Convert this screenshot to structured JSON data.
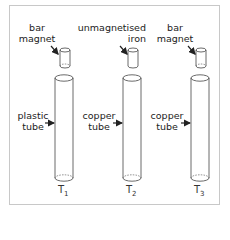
{
  "diagram": {
    "title": "",
    "setups": [
      {
        "id": "T1",
        "tube_label": {
          "base": "T",
          "sub": "1"
        },
        "object": {
          "line1": "bar",
          "line2": "magnet"
        },
        "tube": {
          "line1": "plastic",
          "line2": "tube"
        }
      },
      {
        "id": "T2",
        "tube_label": {
          "base": "T",
          "sub": "2"
        },
        "object": {
          "line1": "unmagnetised",
          "line2": "iron"
        },
        "tube": {
          "line1": "copper",
          "line2": "tube"
        }
      },
      {
        "id": "T3",
        "tube_label": {
          "base": "T",
          "sub": "3"
        },
        "object": {
          "line1": "bar",
          "line2": "magnet"
        },
        "tube": {
          "line1": "copper",
          "line2": "tube"
        }
      }
    ],
    "colors": {
      "stroke": "#333333",
      "frame": "#c8c8c8",
      "text": "#222222"
    }
  }
}
